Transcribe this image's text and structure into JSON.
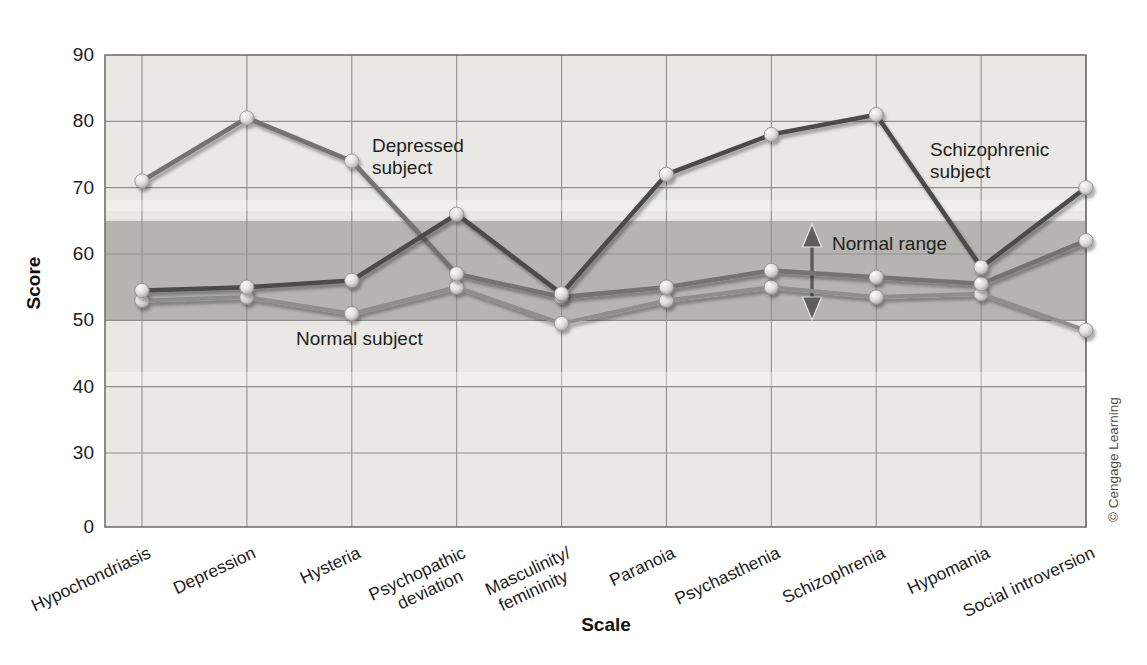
{
  "chart_data": {
    "type": "line",
    "title": "",
    "xlabel": "Scale",
    "ylabel": "Score",
    "ylim": [
      0,
      90
    ],
    "y_ticks": [
      0,
      30,
      40,
      50,
      60,
      70,
      80,
      90
    ],
    "y_axis_note": "axis compressed between 0 and 30",
    "grid": "both",
    "legend_position": "inline-annotations",
    "categories": [
      "Hypochondriasis",
      "Depression",
      "Hysteria",
      "Psychopathic deviation",
      "Masculinity/femininity",
      "Paranoia",
      "Psychasthenia",
      "Schizophrenia",
      "Hypomania",
      "Social introversion"
    ],
    "series": [
      {
        "name": "Normal subject",
        "values": [
          53,
          53.5,
          51,
          55,
          49.5,
          53,
          55,
          53.5,
          54,
          48.5
        ],
        "color": "#8e8e8a"
      },
      {
        "name": "Depressed subject",
        "values": [
          71,
          80.5,
          74,
          57,
          53.5,
          55,
          57.5,
          56.5,
          55.5,
          62
        ],
        "color": "#73736f"
      },
      {
        "name": "Schizophrenic subject",
        "values": [
          54.5,
          55,
          56,
          66,
          54,
          72,
          78,
          81,
          58,
          70
        ],
        "color": "#4c4c4a"
      }
    ],
    "normal_range": {
      "label": "Normal range",
      "from": 50,
      "to": 65
    },
    "annotations": [
      {
        "id": "depressed-subject-label",
        "lines": [
          "Depressed",
          "subject"
        ],
        "x": 372,
        "y": 152,
        "anchor": "start"
      },
      {
        "id": "schizophrenic-subject-label",
        "lines": [
          "Schizophrenic",
          "subject"
        ],
        "x": 930,
        "y": 156,
        "anchor": "start"
      },
      {
        "id": "normal-subject-label",
        "lines": [
          "Normal subject"
        ],
        "x": 296,
        "y": 345,
        "anchor": "start"
      },
      {
        "id": "normal-range-label",
        "lines": [
          "Normal range"
        ],
        "x": 832,
        "y": 250,
        "anchor": "start"
      }
    ],
    "credit": "© Cengage Learning",
    "colors": {
      "plot_bg": "#e9e8e4",
      "band": "#b5b4b0",
      "grid": "#8f8f8d",
      "border": "#71716f",
      "text": "#1d1d1b",
      "marker": "#d9d8d5"
    }
  }
}
